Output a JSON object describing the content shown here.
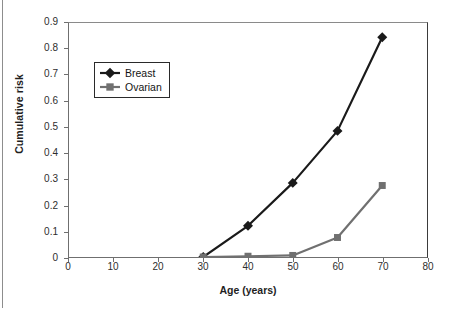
{
  "chart_data": {
    "type": "line",
    "title": "",
    "xlabel": "Age (years)",
    "ylabel": "Cumulative risk",
    "xlim": [
      0,
      80
    ],
    "ylim": [
      0,
      0.9
    ],
    "xticks": [
      0,
      10,
      20,
      30,
      40,
      50,
      60,
      70,
      80
    ],
    "xtick_labels": [
      "0",
      "10",
      "20",
      "30",
      "40",
      "50",
      "60",
      "70",
      "80"
    ],
    "yticks": [
      0,
      0.1,
      0.2,
      0.3,
      0.4,
      0.5,
      0.6,
      0.7,
      0.8,
      0.9
    ],
    "ytick_labels": [
      "0",
      "0.1",
      "0.2",
      "0.3",
      "0.4",
      "0.5",
      "0.6",
      "0.7",
      "0.8",
      "0.9"
    ],
    "grid": false,
    "legend_position": "upper-left-inside",
    "x": [
      30,
      40,
      50,
      60,
      70
    ],
    "series": [
      {
        "name": "Breast",
        "values": [
          0.0,
          0.12,
          0.285,
          0.485,
          0.845
        ],
        "color": "#1a1a1a",
        "marker": "diamond"
      },
      {
        "name": "Ovarian",
        "values": [
          0.0,
          0.003,
          0.006,
          0.075,
          0.275
        ],
        "color": "#707070",
        "marker": "square"
      }
    ]
  },
  "legend": {
    "items": [
      {
        "label": "Breast",
        "color": "#1a1a1a",
        "marker": "diamond"
      },
      {
        "label": "Ovarian",
        "color": "#707070",
        "marker": "square"
      }
    ]
  },
  "axes": {
    "x_title": "Age (years)",
    "y_title": "Cumulative risk"
  }
}
